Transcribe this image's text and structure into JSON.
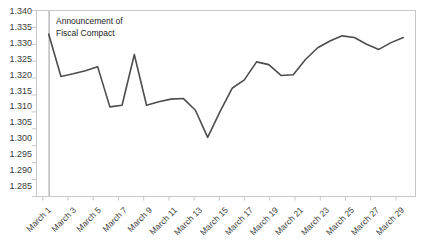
{
  "chart_data": {
    "type": "line",
    "title": "",
    "xlabel": "",
    "ylabel": "",
    "ylim": [
      1.285,
      1.34
    ],
    "ytick_step": 0.005,
    "yticks": [
      "1.340",
      "1.335",
      "1.330",
      "1.325",
      "1.320",
      "1.315",
      "1.310",
      "1.305",
      "1.300",
      "1.295",
      "1.290",
      "1.285"
    ],
    "xticks": [
      "March 1",
      "March 3",
      "March 5",
      "March 7",
      "March 9",
      "March 11",
      "March 13",
      "March 15",
      "March 17",
      "March 19",
      "March 21",
      "March 23",
      "March 25",
      "March 27",
      "March 29"
    ],
    "x": [
      "March 1",
      "March 2",
      "March 3",
      "March 4",
      "March 5",
      "March 6",
      "March 7",
      "March 8",
      "March 9",
      "March 10",
      "March 11",
      "March 12",
      "March 13",
      "March 14",
      "March 15",
      "March 16",
      "March 17",
      "March 18",
      "March 19",
      "March 20",
      "March 21",
      "March 22",
      "March 23",
      "March 24",
      "March 25",
      "March 26",
      "March 27",
      "March 28",
      "March 29",
      "March 30"
    ],
    "values": [
      1.333,
      1.3205,
      1.3213,
      1.3222,
      1.3234,
      1.3115,
      1.312,
      1.327,
      1.312,
      1.313,
      1.3138,
      1.314,
      1.3105,
      1.3025,
      1.31,
      1.317,
      1.3195,
      1.3248,
      1.324,
      1.3208,
      1.321,
      1.3255,
      1.329,
      1.331,
      1.3325,
      1.332,
      1.33,
      1.3285,
      1.3305,
      1.332
    ],
    "grid": false,
    "legend": "none",
    "line_color": "#4d4d4d",
    "axis_color": "#c8c8c8",
    "tick_label_color": "#3b3b3b",
    "annotations": [
      {
        "name": "announcement-marker",
        "line1": "Announcement of",
        "line2": "Fiscal Compact",
        "at_x": "March 2",
        "marker_type": "vertical-line",
        "marker_color": "#9a9a9a"
      }
    ]
  }
}
